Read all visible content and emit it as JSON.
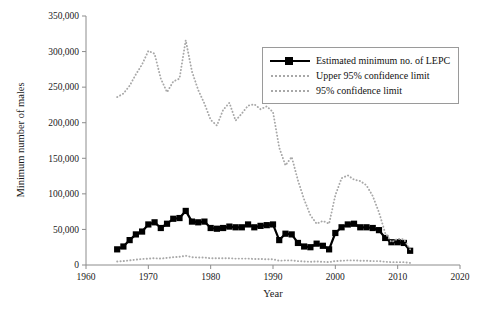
{
  "chart_data": {
    "type": "line",
    "title": "",
    "xlabel": "Year",
    "ylabel": "Minimum number of males",
    "xlim": [
      1960,
      2020
    ],
    "ylim": [
      0,
      350000
    ],
    "xticks": [
      "1960",
      "1970",
      "1980",
      "1990",
      "2000",
      "2010",
      "2020"
    ],
    "xtick_values": [
      1960,
      1970,
      1980,
      1990,
      2000,
      2010,
      2020
    ],
    "yticks": [
      "0",
      "50,000",
      "100,000",
      "150,000",
      "200,000",
      "250,000",
      "300,000",
      "350,000"
    ],
    "ytick_values": [
      0,
      50000,
      100000,
      150000,
      200000,
      250000,
      300000,
      350000
    ],
    "grid": false,
    "legend_position": "top-right",
    "x": [
      1965,
      1966,
      1967,
      1968,
      1969,
      1970,
      1971,
      1972,
      1973,
      1974,
      1975,
      1976,
      1977,
      1978,
      1979,
      1980,
      1981,
      1982,
      1983,
      1984,
      1985,
      1986,
      1987,
      1988,
      1989,
      1990,
      1991,
      1992,
      1993,
      1994,
      1995,
      1996,
      1997,
      1998,
      1999,
      2000,
      2001,
      2002,
      2003,
      2004,
      2005,
      2006,
      2007,
      2008,
      2009,
      2010,
      2011,
      2012
    ],
    "series": [
      {
        "name": "Estimated minimum no. of LEPC",
        "style": "solid-square",
        "color": "#000000",
        "values": [
          22000,
          26000,
          35000,
          43000,
          47000,
          57000,
          60000,
          52000,
          58000,
          65000,
          66000,
          76000,
          61000,
          60000,
          61000,
          52000,
          51000,
          52000,
          54000,
          53000,
          53000,
          57000,
          53000,
          55000,
          56000,
          57000,
          35000,
          44000,
          43000,
          31000,
          26000,
          25000,
          30000,
          27000,
          22000,
          45000,
          53000,
          57000,
          58000,
          53000,
          53000,
          52000,
          49000,
          38000,
          32000,
          32000,
          31000,
          20000
        ]
      },
      {
        "name": "Upper 95% confidence limit",
        "style": "dotted",
        "color": "#a8a8a8",
        "values": [
          236000,
          241000,
          252000,
          268000,
          282000,
          301000,
          297000,
          262000,
          243000,
          258000,
          262000,
          316000,
          272000,
          246000,
          227000,
          204000,
          196000,
          218000,
          228000,
          203000,
          213000,
          224000,
          226000,
          219000,
          223000,
          215000,
          165000,
          140000,
          152000,
          119000,
          92000,
          70000,
          58000,
          62000,
          58000,
          98000,
          122000,
          126000,
          120000,
          118000,
          112000,
          97000,
          74000,
          45000,
          32000,
          37000,
          36000,
          22000
        ]
      },
      {
        "name": "95% confidence limit",
        "style": "dotted",
        "color": "#a8a8a8",
        "values": [
          5000,
          5500,
          6500,
          7500,
          8500,
          9000,
          9500,
          9000,
          10000,
          11000,
          11500,
          13000,
          11000,
          10500,
          10500,
          9500,
          9500,
          9500,
          9500,
          9000,
          9000,
          9000,
          8500,
          8500,
          8000,
          8000,
          6000,
          6500,
          6500,
          5500,
          5000,
          4500,
          5000,
          4500,
          4000,
          5500,
          6000,
          6500,
          6500,
          6000,
          6000,
          5500,
          5500,
          4500,
          4000,
          4000,
          4000,
          3000
        ]
      }
    ]
  },
  "legend": {
    "items": [
      {
        "label": "Estimated minimum no. of LEPC",
        "key": "solid-square"
      },
      {
        "label": "Upper 95% confidence limit",
        "key": "dotted"
      },
      {
        "label": "95% confidence limit",
        "key": "dotted"
      }
    ]
  },
  "axes": {
    "x_title": "Year",
    "y_title": "Minimum number of males"
  }
}
